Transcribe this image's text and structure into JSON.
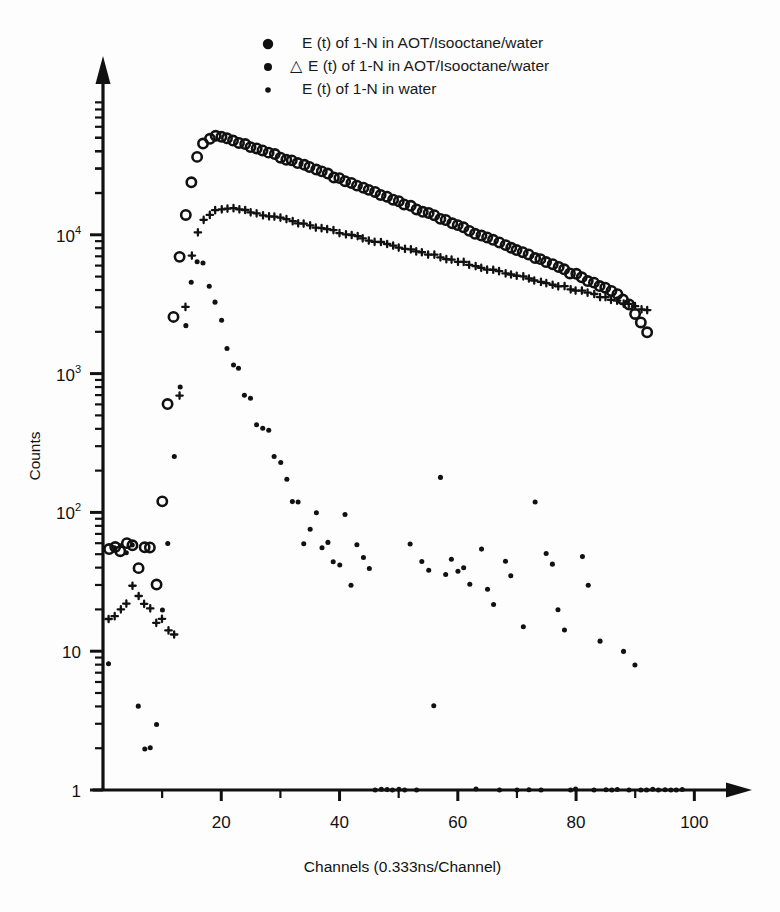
{
  "figure": {
    "background": "#fdfdfd",
    "ink_color": "#111111"
  },
  "chart_data": {
    "type": "scatter",
    "title": "",
    "xlabel": "Channels (0.333ns/Channel)",
    "ylabel": "Counts",
    "yscale": "log",
    "xlim": [
      0,
      104
    ],
    "ylim": [
      1,
      100000
    ],
    "grid": false,
    "legend_position": "top-center",
    "x_ticks_major": [
      20,
      40,
      60,
      80,
      100
    ],
    "x_ticks_minor": [
      10,
      30,
      50,
      70,
      90
    ],
    "x_tick_labels": [
      "20",
      "40",
      "60",
      "80",
      "100"
    ],
    "y_ticks_major": [
      1,
      10,
      100,
      1000,
      10000
    ],
    "y_tick_labels": [
      "1",
      "10",
      "10^2",
      "10^3",
      "10^4"
    ],
    "y_tick_label_parts": [
      {
        "base": "1",
        "exp": ""
      },
      {
        "base": "10",
        "exp": ""
      },
      {
        "base": "10",
        "exp": "2"
      },
      {
        "base": "10",
        "exp": "3"
      },
      {
        "base": "10",
        "exp": "4"
      }
    ],
    "series": [
      {
        "name": "E (t) of 1-N in AOT/Isooctane/water",
        "marker": "open-circle-large",
        "marker_size": 6.0,
        "legend_prefix": "",
        "points": [
          [
            1,
            55
          ],
          [
            2,
            57
          ],
          [
            3,
            52
          ],
          [
            4,
            60
          ],
          [
            5,
            58
          ],
          [
            6,
            40
          ],
          [
            7,
            56
          ],
          [
            8,
            55
          ],
          [
            9,
            30
          ],
          [
            10,
            120
          ],
          [
            11,
            600
          ],
          [
            12,
            2600
          ],
          [
            13,
            7000
          ],
          [
            14,
            14000
          ],
          [
            15,
            24000
          ],
          [
            16,
            36000
          ],
          [
            17,
            45000
          ],
          [
            18,
            50000
          ],
          [
            19,
            52000
          ],
          [
            20,
            51000
          ],
          [
            21,
            49500
          ],
          [
            22,
            48000
          ],
          [
            23,
            46500
          ],
          [
            24,
            45000
          ],
          [
            25,
            43500
          ],
          [
            26,
            42000
          ],
          [
            27,
            40500
          ],
          [
            28,
            39000
          ],
          [
            29,
            37800
          ],
          [
            30,
            36500
          ],
          [
            31,
            35200
          ],
          [
            32,
            34000
          ],
          [
            33,
            32800
          ],
          [
            34,
            31600
          ],
          [
            35,
            30500
          ],
          [
            36,
            29400
          ],
          [
            37,
            28300
          ],
          [
            38,
            27300
          ],
          [
            39,
            26300
          ],
          [
            40,
            25300
          ],
          [
            41,
            24400
          ],
          [
            42,
            23500
          ],
          [
            43,
            22600
          ],
          [
            44,
            21800
          ],
          [
            45,
            21000
          ],
          [
            46,
            20200
          ],
          [
            47,
            19400
          ],
          [
            48,
            18700
          ],
          [
            49,
            18000
          ],
          [
            50,
            17300
          ],
          [
            51,
            16600
          ],
          [
            52,
            16000
          ],
          [
            53,
            15400
          ],
          [
            54,
            14800
          ],
          [
            55,
            14200
          ],
          [
            56,
            13650
          ],
          [
            57,
            13100
          ],
          [
            58,
            12600
          ],
          [
            59,
            12100
          ],
          [
            60,
            11600
          ],
          [
            61,
            11150
          ],
          [
            62,
            10700
          ],
          [
            63,
            10300
          ],
          [
            64,
            9900
          ],
          [
            65,
            9500
          ],
          [
            66,
            9100
          ],
          [
            67,
            8750
          ],
          [
            68,
            8400
          ],
          [
            69,
            8050
          ],
          [
            70,
            7750
          ],
          [
            71,
            7450
          ],
          [
            72,
            7150
          ],
          [
            73,
            6850
          ],
          [
            74,
            6600
          ],
          [
            75,
            6300
          ],
          [
            76,
            6050
          ],
          [
            77,
            5800
          ],
          [
            78,
            5580
          ],
          [
            79,
            5350
          ],
          [
            80,
            5150
          ],
          [
            81,
            4900
          ],
          [
            82,
            4700
          ],
          [
            83,
            4500
          ],
          [
            84,
            4300
          ],
          [
            85,
            4100
          ],
          [
            86,
            3900
          ],
          [
            87,
            3700
          ],
          [
            88,
            3400
          ],
          [
            89,
            3100
          ],
          [
            90,
            2700
          ],
          [
            91,
            2300
          ],
          [
            92,
            2000
          ]
        ]
      },
      {
        "name": "E (t) of 1-N in AOT/Isooctane/water",
        "marker": "cross-small",
        "marker_size": 3.2,
        "legend_prefix": "△",
        "points": [
          [
            1,
            17
          ],
          [
            2,
            18
          ],
          [
            3,
            20
          ],
          [
            4,
            22
          ],
          [
            5,
            30
          ],
          [
            6,
            25
          ],
          [
            7,
            22
          ],
          [
            8,
            20
          ],
          [
            9,
            16
          ],
          [
            10,
            17
          ],
          [
            11,
            14
          ],
          [
            12,
            13
          ],
          [
            13,
            700
          ],
          [
            14,
            3000
          ],
          [
            15,
            7000
          ],
          [
            16,
            10500
          ],
          [
            17,
            12800
          ],
          [
            18,
            14000
          ],
          [
            19,
            14800
          ],
          [
            20,
            15200
          ],
          [
            21,
            15400
          ],
          [
            22,
            15300
          ],
          [
            23,
            15100
          ],
          [
            24,
            14900
          ],
          [
            25,
            14600
          ],
          [
            26,
            14300
          ],
          [
            27,
            14000
          ],
          [
            28,
            13700
          ],
          [
            29,
            13400
          ],
          [
            30,
            13100
          ],
          [
            31,
            12800
          ],
          [
            32,
            12500
          ],
          [
            33,
            12200
          ],
          [
            34,
            11900
          ],
          [
            35,
            11650
          ],
          [
            36,
            11400
          ],
          [
            37,
            11150
          ],
          [
            38,
            10900
          ],
          [
            39,
            10650
          ],
          [
            40,
            10400
          ],
          [
            41,
            10150
          ],
          [
            42,
            9900
          ],
          [
            43,
            9650
          ],
          [
            44,
            9450
          ],
          [
            45,
            9200
          ],
          [
            46,
            9000
          ],
          [
            47,
            8800
          ],
          [
            48,
            8600
          ],
          [
            49,
            8400
          ],
          [
            50,
            8200
          ],
          [
            51,
            8000
          ],
          [
            52,
            7800
          ],
          [
            53,
            7600
          ],
          [
            54,
            7450
          ],
          [
            55,
            7250
          ],
          [
            56,
            7100
          ],
          [
            57,
            6900
          ],
          [
            58,
            6750
          ],
          [
            59,
            6600
          ],
          [
            60,
            6450
          ],
          [
            61,
            6300
          ],
          [
            62,
            6150
          ],
          [
            63,
            6000
          ],
          [
            64,
            5850
          ],
          [
            65,
            5700
          ],
          [
            66,
            5600
          ],
          [
            67,
            5450
          ],
          [
            68,
            5300
          ],
          [
            69,
            5200
          ],
          [
            70,
            5050
          ],
          [
            71,
            4950
          ],
          [
            72,
            4800
          ],
          [
            73,
            4700
          ],
          [
            74,
            4600
          ],
          [
            75,
            4500
          ],
          [
            76,
            4400
          ],
          [
            77,
            4300
          ],
          [
            78,
            4200
          ],
          [
            79,
            4100
          ],
          [
            80,
            4000
          ],
          [
            81,
            3900
          ],
          [
            82,
            3800
          ],
          [
            83,
            3700
          ],
          [
            84,
            3600
          ],
          [
            85,
            3500
          ],
          [
            86,
            3400
          ],
          [
            87,
            3320
          ],
          [
            88,
            3240
          ],
          [
            89,
            3150
          ],
          [
            90,
            3050
          ],
          [
            91,
            2950
          ],
          [
            92,
            2850
          ]
        ]
      },
      {
        "name": "E (t) of 1-N in water",
        "marker": "dot-medium",
        "marker_size": 4.2,
        "legend_prefix": "",
        "points": [
          [
            1,
            8
          ],
          [
            2,
            55
          ],
          [
            3,
            57
          ],
          [
            4,
            52
          ],
          [
            5,
            58
          ],
          [
            6,
            4
          ],
          [
            7,
            2
          ],
          [
            8,
            2
          ],
          [
            9,
            3
          ],
          [
            10,
            20
          ],
          [
            11,
            60
          ],
          [
            12,
            250
          ],
          [
            13,
            800
          ],
          [
            14,
            2200
          ],
          [
            15,
            4600
          ],
          [
            16,
            6500
          ],
          [
            17,
            6200
          ],
          [
            18,
            4200
          ],
          [
            19,
            3300
          ],
          [
            20,
            2400
          ],
          [
            21,
            1500
          ],
          [
            22,
            1150
          ],
          [
            23,
            1100
          ],
          [
            24,
            700
          ],
          [
            25,
            660
          ],
          [
            26,
            430
          ],
          [
            27,
            400
          ],
          [
            28,
            390
          ],
          [
            29,
            250
          ],
          [
            30,
            230
          ],
          [
            31,
            175
          ],
          [
            32,
            120
          ],
          [
            33,
            118
          ],
          [
            34,
            60
          ],
          [
            35,
            75
          ],
          [
            36,
            100
          ],
          [
            37,
            55
          ],
          [
            38,
            60
          ],
          [
            39,
            44
          ],
          [
            40,
            42
          ],
          [
            41,
            95
          ],
          [
            42,
            30
          ],
          [
            43,
            58
          ],
          [
            44,
            48
          ],
          [
            45,
            40
          ],
          [
            46,
            1
          ],
          [
            47,
            1
          ],
          [
            48,
            1
          ],
          [
            49,
            1
          ],
          [
            50,
            1
          ],
          [
            51,
            1
          ],
          [
            52,
            60
          ],
          [
            53,
            1
          ],
          [
            54,
            44
          ],
          [
            55,
            38
          ],
          [
            56,
            4
          ],
          [
            57,
            180
          ],
          [
            58,
            36
          ],
          [
            59,
            46
          ],
          [
            60,
            38
          ],
          [
            61,
            40
          ],
          [
            62,
            30
          ],
          [
            63,
            1
          ],
          [
            64,
            55
          ],
          [
            65,
            28
          ],
          [
            66,
            22
          ],
          [
            67,
            1
          ],
          [
            68,
            44
          ],
          [
            69,
            35
          ],
          [
            70,
            1
          ],
          [
            71,
            15
          ],
          [
            72,
            1
          ],
          [
            73,
            120
          ],
          [
            74,
            1
          ],
          [
            75,
            50
          ],
          [
            76,
            43
          ],
          [
            77,
            20
          ],
          [
            78,
            14
          ],
          [
            79,
            1
          ],
          [
            80,
            1
          ],
          [
            81,
            48
          ],
          [
            82,
            30
          ],
          [
            83,
            1
          ],
          [
            84,
            12
          ],
          [
            85,
            1
          ],
          [
            86,
            1
          ],
          [
            87,
            1
          ],
          [
            88,
            10
          ],
          [
            89,
            1
          ],
          [
            90,
            8
          ],
          [
            91,
            1
          ],
          [
            92,
            1
          ],
          [
            93,
            1
          ],
          [
            94,
            1
          ],
          [
            95,
            1
          ],
          [
            96,
            1
          ],
          [
            97,
            1
          ],
          [
            98,
            1
          ]
        ]
      }
    ],
    "legend": [
      {
        "prefix": "",
        "label": "E (t) of 1-N in AOT/Isooctane/water",
        "marker": "dot-large"
      },
      {
        "prefix": "△",
        "label": "E (t) of 1-N in AOT/Isooctane/water",
        "marker": "dot-medium"
      },
      {
        "prefix": "",
        "label": "E (t) of 1-N in water",
        "marker": "dot-small"
      }
    ]
  }
}
